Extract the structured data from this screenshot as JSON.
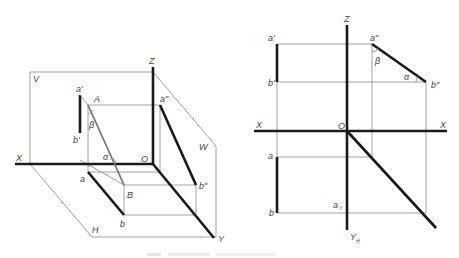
{
  "figure": {
    "left_view": {
      "title": "pictorial-projection",
      "planes": {
        "V": "V",
        "H": "H",
        "W": "W"
      },
      "axes": {
        "X": "X",
        "Y": "Y",
        "Z": "Z",
        "O": "O"
      },
      "points": {
        "A": "A",
        "B": "B",
        "a_prime": "a'",
        "b_prime": "b'",
        "a_dprime": "a\"",
        "b_dprime": "b\"",
        "a": "a",
        "b": "b"
      },
      "angles": {
        "alpha": "α",
        "beta": "β"
      }
    },
    "right_view": {
      "title": "orthographic-projection",
      "axes": {
        "X_left": "X",
        "X_right": "X",
        "Z": "Z",
        "O": "O",
        "YH": "Y",
        "YH_sub": "H"
      },
      "points": {
        "a_prime": "a'",
        "b_prime": "b'",
        "a_dprime": "a\"",
        "b_dprime": "b\"",
        "a": "a",
        "b": "b",
        "ax": "a",
        "ax_sub": "Y"
      },
      "angles": {
        "alpha": "α",
        "beta": "β"
      }
    },
    "caption": ""
  }
}
